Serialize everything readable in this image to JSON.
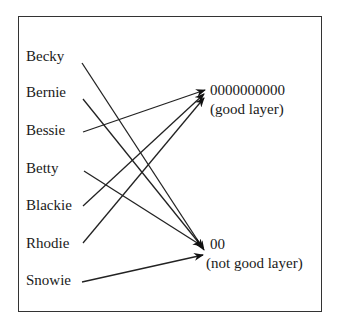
{
  "diagram": {
    "sources": [
      {
        "name": "Becky",
        "x": 26,
        "y": 48,
        "line": [
          82,
          63
        ],
        "target": "bad"
      },
      {
        "name": "Bernie",
        "x": 26,
        "y": 84,
        "line": [
          83,
          99
        ],
        "target": "bad"
      },
      {
        "name": "Bessie",
        "x": 26,
        "y": 122,
        "line": [
          83,
          132
        ],
        "target": "good"
      },
      {
        "name": "Betty",
        "x": 26,
        "y": 160,
        "line": [
          84,
          171
        ],
        "target": "bad"
      },
      {
        "name": "Blackie",
        "x": 26,
        "y": 197,
        "line": [
          83,
          206
        ],
        "target": "good"
      },
      {
        "name": "Rhodie",
        "x": 26,
        "y": 235,
        "line": [
          83,
          243
        ],
        "target": "good"
      },
      {
        "name": "Snowie",
        "x": 26,
        "y": 272,
        "line": [
          82,
          282
        ],
        "target": "bad"
      }
    ],
    "targets": {
      "good": {
        "value": "0000000000",
        "caption": "(good layer)",
        "x": 210,
        "y": 82
      },
      "bad": {
        "value": "00",
        "caption": "(not good layer)",
        "x": 210,
        "y": 236
      }
    }
  }
}
